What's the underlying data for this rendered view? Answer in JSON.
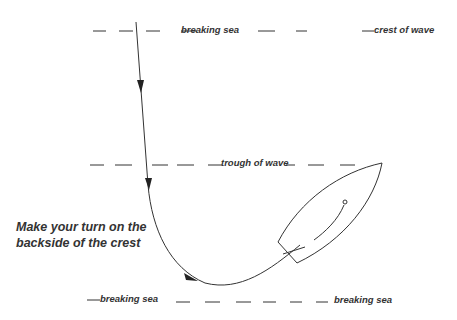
{
  "diagram": {
    "labels": {
      "top_breaking_sea": "breaking sea",
      "crest_of_wave": "crest of wave",
      "trough_of_wave": "trough of wave",
      "bottom_breaking_sea_left": "breaking sea",
      "bottom_breaking_sea_right": "breaking sea",
      "instruction_line1": "Make your turn on the",
      "instruction_line2": "backside of the crest"
    },
    "colors": {
      "line": "#333333",
      "text": "#333333",
      "background": "#ffffff"
    }
  }
}
